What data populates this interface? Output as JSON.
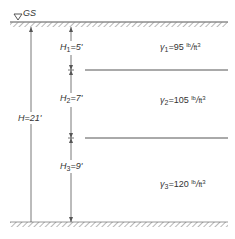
{
  "diagram": {
    "ground_surface_label": "GS",
    "total_height": {
      "symbol": "H",
      "value": "21'"
    },
    "layers": [
      {
        "h_symbol": "H",
        "h_index": "1",
        "h_value": "5'",
        "gamma_symbol": "γ",
        "gamma_index": "1",
        "gamma_value": "95",
        "unit_num": "lb",
        "unit_den": "ft",
        "unit_exp": "3"
      },
      {
        "h_symbol": "H",
        "h_index": "2",
        "h_value": "7'",
        "gamma_symbol": "γ",
        "gamma_index": "2",
        "gamma_value": "105",
        "unit_num": "lb",
        "unit_den": "ft",
        "unit_exp": "3"
      },
      {
        "h_symbol": "H",
        "h_index": "3",
        "h_value": "9'",
        "gamma_symbol": "γ",
        "gamma_index": "3",
        "gamma_value": "120",
        "unit_num": "lb",
        "unit_den": "ft",
        "unit_exp": "3"
      }
    ],
    "colors": {
      "line": "#555555",
      "hatch": "#888888"
    }
  }
}
